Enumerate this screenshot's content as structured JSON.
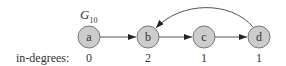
{
  "graph": {
    "title": "G",
    "title_subscript": "10",
    "row_label": "in-degrees:",
    "node_fill": "#cccccc",
    "node_stroke": "#777777",
    "edge_color": "#555555",
    "nodes": [
      {
        "id": "a",
        "label": "a",
        "in_degree": "0"
      },
      {
        "id": "b",
        "label": "b",
        "in_degree": "2"
      },
      {
        "id": "c",
        "label": "c",
        "in_degree": "1"
      },
      {
        "id": "d",
        "label": "d",
        "in_degree": "1"
      }
    ],
    "edges": [
      {
        "from": "a",
        "to": "b"
      },
      {
        "from": "b",
        "to": "c"
      },
      {
        "from": "c",
        "to": "d"
      },
      {
        "from": "d",
        "to": "b",
        "curved": true
      }
    ]
  }
}
